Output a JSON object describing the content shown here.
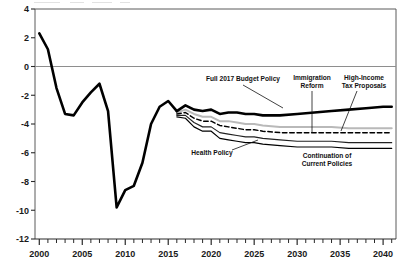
{
  "chart_data": {
    "type": "line",
    "title": "",
    "xlabel": "",
    "ylabel": "",
    "xlim": [
      1999.5,
      2041.5
    ],
    "ylim": [
      -12,
      4
    ],
    "grid": false,
    "zero_line": true,
    "legend_position": "inline-annotations",
    "y_ticks": [
      4,
      2,
      0,
      -2,
      -4,
      -6,
      -8,
      -10,
      -12
    ],
    "y_tick_labels": [
      "4",
      "2",
      "0",
      "-2",
      "-4",
      "-6",
      "-8",
      "-10",
      "-12"
    ],
    "x_ticks": [
      2000,
      2005,
      2010,
      2015,
      2020,
      2025,
      2030,
      2035,
      2040
    ],
    "x_tick_labels": [
      "2000",
      "2005",
      "2010",
      "2015",
      "2020",
      "2025",
      "2030",
      "2035",
      "2040"
    ],
    "x_minor_tick_step": 1,
    "series": [
      {
        "name": "Historical",
        "style": "solid-thick-black",
        "color": "#000000",
        "x": [
          2000,
          2001,
          2002,
          2003,
          2004,
          2005,
          2006,
          2007,
          2008,
          2009,
          2010,
          2011,
          2012,
          2013,
          2014,
          2015,
          2016
        ],
        "values": [
          2.3,
          1.2,
          -1.5,
          -3.3,
          -3.4,
          -2.5,
          -1.8,
          -1.2,
          -3.1,
          -9.8,
          -8.6,
          -8.3,
          -6.7,
          -4.0,
          -2.8,
          -2.4,
          -3.1
        ]
      },
      {
        "name": "Full 2017 Budget Policy",
        "style": "solid-thick-black",
        "color": "#000000",
        "x": [
          2016,
          2017,
          2018,
          2019,
          2020,
          2021,
          2022,
          2023,
          2024,
          2025,
          2026,
          2027,
          2028,
          2030,
          2032,
          2034,
          2036,
          2038,
          2040,
          2041
        ],
        "values": [
          -3.1,
          -2.7,
          -3.0,
          -3.1,
          -3.0,
          -3.3,
          -3.2,
          -3.2,
          -3.3,
          -3.3,
          -3.4,
          -3.4,
          -3.4,
          -3.3,
          -3.2,
          -3.1,
          -3.0,
          -2.9,
          -2.8,
          -2.8
        ]
      },
      {
        "name": "Immigration Reform",
        "style": "solid-thin-lightgray",
        "color": "#b9b9b9",
        "x": [
          2016,
          2017,
          2018,
          2019,
          2020,
          2021,
          2022,
          2023,
          2024,
          2025,
          2026,
          2028,
          2030,
          2032,
          2034,
          2036,
          2038,
          2040,
          2041
        ],
        "values": [
          -3.2,
          -3.0,
          -3.3,
          -3.5,
          -3.5,
          -3.8,
          -3.8,
          -3.9,
          -4.0,
          -4.0,
          -4.1,
          -4.2,
          -4.2,
          -4.2,
          -4.2,
          -4.3,
          -4.3,
          -4.3,
          -4.3
        ]
      },
      {
        "name": "High-Income Tax Proposals",
        "style": "dashed-black",
        "color": "#000000",
        "x": [
          2016,
          2017,
          2018,
          2019,
          2020,
          2021,
          2022,
          2023,
          2024,
          2025,
          2026,
          2028,
          2030,
          2032,
          2034,
          2036,
          2038,
          2040,
          2041
        ],
        "values": [
          -3.3,
          -3.2,
          -3.6,
          -3.8,
          -3.8,
          -4.1,
          -4.2,
          -4.3,
          -4.4,
          -4.4,
          -4.5,
          -4.6,
          -4.6,
          -4.6,
          -4.6,
          -4.6,
          -4.6,
          -4.6,
          -4.6
        ]
      },
      {
        "name": "Health Policy",
        "style": "solid-thin-black",
        "color": "#222222",
        "x": [
          2016,
          2017,
          2018,
          2019,
          2020,
          2021,
          2022,
          2023,
          2024,
          2025,
          2026,
          2028,
          2030,
          2032,
          2034,
          2036,
          2038,
          2040,
          2041
        ],
        "values": [
          -3.4,
          -3.4,
          -3.9,
          -4.2,
          -4.2,
          -4.6,
          -4.7,
          -4.8,
          -4.9,
          -4.9,
          -5.0,
          -5.1,
          -5.2,
          -5.2,
          -5.2,
          -5.3,
          -5.3,
          -5.3,
          -5.3
        ]
      },
      {
        "name": "Continuation of Current Policies",
        "style": "solid-thin-black",
        "color": "#000000",
        "x": [
          2016,
          2017,
          2018,
          2019,
          2020,
          2021,
          2022,
          2023,
          2024,
          2025,
          2026,
          2028,
          2030,
          2032,
          2034,
          2036,
          2038,
          2040,
          2041
        ],
        "values": [
          -3.5,
          -3.6,
          -4.2,
          -4.5,
          -4.5,
          -5.0,
          -5.1,
          -5.2,
          -5.3,
          -5.3,
          -5.4,
          -5.5,
          -5.6,
          -5.6,
          -5.6,
          -5.7,
          -5.7,
          -5.7,
          -5.7
        ]
      }
    ],
    "annotations": [
      {
        "id": "full-2017-budget-policy",
        "label": "Full 2017 Budget Policy",
        "lines": [
          "Full 2017 Budget Policy"
        ],
        "text_x": 243,
        "text_y": 81,
        "anchor": "middle",
        "leader": [
          [
            243,
            85
          ],
          [
            283,
            108
          ]
        ]
      },
      {
        "id": "immigration-reform",
        "label": "Immigration Reform",
        "lines": [
          "Immigration",
          "Reform"
        ],
        "text_x": 312,
        "text_y": 80,
        "anchor": "middle",
        "leader": [
          [
            312,
            91
          ],
          [
            312,
            133
          ]
        ]
      },
      {
        "id": "high-income-tax-proposals",
        "label": "High-Income Tax Proposals",
        "lines": [
          "High-Income",
          "Tax Proposals"
        ],
        "text_x": 364,
        "text_y": 80,
        "anchor": "middle",
        "leader": [
          [
            357,
            91
          ],
          [
            341,
            131
          ]
        ]
      },
      {
        "id": "health-policy",
        "label": "Health Policy",
        "lines": [
          "Health Policy"
        ],
        "text_x": 212,
        "text_y": 155,
        "anchor": "middle",
        "leader": [
          [
            232,
            150
          ],
          [
            258,
            140
          ]
        ]
      },
      {
        "id": "continuation-of-current-policies",
        "label": "Continuation of Current Policies",
        "lines": [
          "Continuation of",
          "Current Policies"
        ],
        "text_x": 327,
        "text_y": 158,
        "anchor": "middle",
        "leader": null
      }
    ]
  }
}
